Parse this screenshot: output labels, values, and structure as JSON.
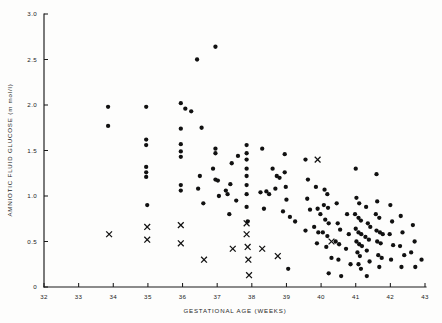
{
  "chart_data": {
    "type": "scatter",
    "title": "",
    "xlabel": "GESTATIONAL AGE (WEEKS)",
    "ylabel": "AMNIOTIC FLUID GLUCOSE (m mol/l)",
    "xlim": [
      32,
      43
    ],
    "ylim": [
      0,
      3.0
    ],
    "grid": false,
    "legend_position": "none",
    "xticks": [
      32,
      33,
      34,
      35,
      36,
      37,
      38,
      39,
      40,
      41,
      42,
      43
    ],
    "xticklabels": [
      "32",
      "33",
      "34",
      "35",
      "36",
      "37",
      "38",
      "39",
      "40",
      "41",
      "42",
      "43"
    ],
    "yticks": [
      0,
      0.5,
      1.0,
      1.5,
      2.0,
      2.5,
      3.0
    ],
    "yticklabels": [
      "0",
      "0.5",
      "1.0",
      "1.5",
      "2.0",
      "2.5",
      "3.0"
    ],
    "series": [
      {
        "name": "dot",
        "marker": "circle",
        "color": "#111111",
        "points": [
          [
            33.85,
            1.98
          ],
          [
            33.85,
            1.77
          ],
          [
            34.95,
            1.98
          ],
          [
            34.95,
            1.62
          ],
          [
            34.95,
            1.56
          ],
          [
            34.95,
            1.32
          ],
          [
            34.95,
            1.26
          ],
          [
            34.95,
            1.21
          ],
          [
            34.98,
            0.9
          ],
          [
            35.95,
            2.02
          ],
          [
            36.08,
            1.96
          ],
          [
            36.25,
            1.93
          ],
          [
            35.95,
            1.74
          ],
          [
            35.95,
            1.57
          ],
          [
            35.95,
            1.49
          ],
          [
            35.95,
            1.43
          ],
          [
            35.95,
            1.12
          ],
          [
            35.95,
            1.06
          ],
          [
            36.42,
            2.5
          ],
          [
            36.55,
            1.75
          ],
          [
            36.5,
            1.22
          ],
          [
            36.45,
            1.08
          ],
          [
            36.95,
            2.64
          ],
          [
            36.95,
            1.52
          ],
          [
            36.95,
            1.47
          ],
          [
            36.88,
            1.3
          ],
          [
            36.95,
            1.18
          ],
          [
            37.02,
            1.17
          ],
          [
            37.05,
            1.0
          ],
          [
            36.6,
            0.92
          ],
          [
            37.25,
            1.06
          ],
          [
            37.3,
            1.02
          ],
          [
            37.42,
            1.36
          ],
          [
            37.38,
            1.13
          ],
          [
            37.55,
            0.95
          ],
          [
            37.35,
            0.8
          ],
          [
            37.6,
            1.44
          ],
          [
            37.85,
            1.56
          ],
          [
            37.85,
            1.47
          ],
          [
            37.85,
            1.4
          ],
          [
            37.85,
            1.3
          ],
          [
            37.85,
            1.22
          ],
          [
            37.85,
            1.12
          ],
          [
            37.85,
            1.02
          ],
          [
            37.85,
            0.88
          ],
          [
            37.88,
            0.72
          ],
          [
            38.25,
            1.04
          ],
          [
            38.42,
            1.05
          ],
          [
            38.5,
            1.02
          ],
          [
            38.3,
            1.52
          ],
          [
            38.6,
            1.3
          ],
          [
            38.72,
            1.22
          ],
          [
            38.8,
            1.2
          ],
          [
            38.68,
            1.08
          ],
          [
            38.35,
            0.86
          ],
          [
            38.95,
            1.46
          ],
          [
            38.95,
            1.26
          ],
          [
            38.98,
            1.1
          ],
          [
            39.0,
            0.96
          ],
          [
            38.9,
            0.83
          ],
          [
            39.1,
            0.77
          ],
          [
            39.25,
            0.72
          ],
          [
            39.05,
            0.2
          ],
          [
            39.55,
            1.4
          ],
          [
            39.62,
            1.18
          ],
          [
            39.6,
            0.97
          ],
          [
            39.68,
            0.85
          ],
          [
            39.55,
            0.62
          ],
          [
            39.85,
            1.1
          ],
          [
            39.9,
            0.86
          ],
          [
            39.98,
            0.8
          ],
          [
            39.8,
            0.66
          ],
          [
            39.92,
            0.6
          ],
          [
            39.88,
            0.48
          ],
          [
            40.1,
            1.07
          ],
          [
            40.18,
            1.02
          ],
          [
            40.08,
            0.9
          ],
          [
            40.2,
            0.87
          ],
          [
            40.12,
            0.74
          ],
          [
            40.22,
            0.7
          ],
          [
            40.05,
            0.6
          ],
          [
            40.18,
            0.56
          ],
          [
            40.15,
            0.44
          ],
          [
            40.3,
            0.32
          ],
          [
            40.22,
            0.15
          ],
          [
            40.45,
            0.92
          ],
          [
            40.48,
            0.7
          ],
          [
            40.55,
            0.63
          ],
          [
            40.42,
            0.5
          ],
          [
            40.52,
            0.47
          ],
          [
            40.5,
            0.3
          ],
          [
            40.58,
            0.12
          ],
          [
            40.75,
            0.8
          ],
          [
            40.8,
            0.58
          ],
          [
            40.72,
            0.42
          ],
          [
            40.85,
            0.25
          ],
          [
            41.0,
            1.3
          ],
          [
            41.02,
            0.98
          ],
          [
            41.1,
            0.92
          ],
          [
            40.98,
            0.8
          ],
          [
            41.08,
            0.76
          ],
          [
            41.15,
            0.73
          ],
          [
            41.0,
            0.64
          ],
          [
            41.08,
            0.6
          ],
          [
            41.16,
            0.58
          ],
          [
            41.02,
            0.5
          ],
          [
            41.1,
            0.47
          ],
          [
            41.18,
            0.45
          ],
          [
            41.05,
            0.38
          ],
          [
            41.12,
            0.34
          ],
          [
            41.08,
            0.25
          ],
          [
            41.15,
            0.2
          ],
          [
            41.3,
            0.88
          ],
          [
            41.35,
            0.7
          ],
          [
            41.42,
            0.66
          ],
          [
            41.28,
            0.55
          ],
          [
            41.38,
            0.52
          ],
          [
            41.32,
            0.4
          ],
          [
            41.4,
            0.28
          ],
          [
            41.32,
            0.12
          ],
          [
            41.6,
            1.24
          ],
          [
            41.62,
            0.94
          ],
          [
            41.58,
            0.8
          ],
          [
            41.68,
            0.76
          ],
          [
            41.6,
            0.62
          ],
          [
            41.7,
            0.6
          ],
          [
            41.78,
            0.58
          ],
          [
            41.62,
            0.5
          ],
          [
            41.72,
            0.48
          ],
          [
            41.65,
            0.35
          ],
          [
            41.75,
            0.32
          ],
          [
            41.68,
            0.22
          ],
          [
            42.0,
            0.9
          ],
          [
            42.05,
            0.72
          ],
          [
            41.98,
            0.58
          ],
          [
            42.08,
            0.46
          ],
          [
            42.02,
            0.3
          ],
          [
            42.3,
            0.78
          ],
          [
            42.35,
            0.6
          ],
          [
            42.28,
            0.45
          ],
          [
            42.4,
            0.35
          ],
          [
            42.32,
            0.22
          ],
          [
            42.65,
            0.68
          ],
          [
            42.7,
            0.5
          ],
          [
            42.6,
            0.38
          ],
          [
            42.72,
            0.22
          ],
          [
            42.9,
            0.3
          ]
        ]
      },
      {
        "name": "cross",
        "marker": "x",
        "color": "#111111",
        "points": [
          [
            33.88,
            0.58
          ],
          [
            34.98,
            0.66
          ],
          [
            34.98,
            0.52
          ],
          [
            35.95,
            0.68
          ],
          [
            35.95,
            0.48
          ],
          [
            36.62,
            0.3
          ],
          [
            37.45,
            0.42
          ],
          [
            37.85,
            0.7
          ],
          [
            37.85,
            0.58
          ],
          [
            37.88,
            0.44
          ],
          [
            37.9,
            0.3
          ],
          [
            37.92,
            0.13
          ],
          [
            38.3,
            0.42
          ],
          [
            38.75,
            0.34
          ],
          [
            39.9,
            1.4
          ],
          [
            40.3,
            0.5
          ]
        ]
      }
    ]
  }
}
